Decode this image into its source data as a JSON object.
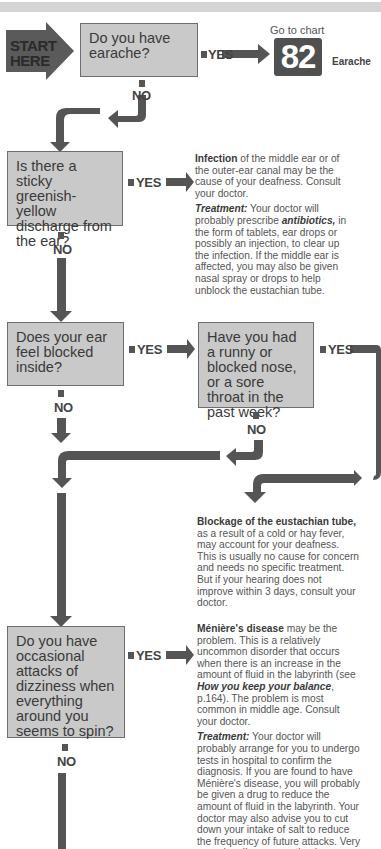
{
  "colors": {
    "box_fill": "#c9c9c9",
    "arrow": "#555555",
    "start_fill": "#5a5a5a",
    "chart_box": "#505050",
    "top_bar": "#d4d4d4"
  },
  "start": {
    "line1": "START",
    "line2": "HERE"
  },
  "labels": {
    "yes": "YES",
    "no": "NO"
  },
  "questions": {
    "q1": "Do you have earache?",
    "q2": "Is there a sticky greenish-yellow discharge from the ear?",
    "q3": "Does your ear feel blocked inside?",
    "q3b": "Have you had a runny or blocked nose, or a sore throat in the past week?",
    "q4": "Do you have occasional attacks of dizziness when everything around you seems to spin?"
  },
  "goto": {
    "prefix": "Go to chart",
    "number": "82",
    "name": "Earache"
  },
  "infection": {
    "title": "Infection",
    "text": " of the middle ear or of the outer-ear canal may be the cause of your deafness. Consult your doctor.",
    "treatment_label": "Treatment:",
    "treatment_a": " Your doctor will probably prescribe ",
    "treatment_em": "antibiotics,",
    "treatment_b": " in the form of tablets, ear drops or possibly an injection, to clear up the infection. If the middle ear is affected, you may also be given nasal spray or drops to help unblock the eustachian tube."
  },
  "blockage": {
    "title": "Blockage of the eustachian tube,",
    "text": " as a result of a cold or hay fever, may account for your deafness. This is usually no cause for concern and needs no specific treatment. But if your hearing does not improve within 3 days, consult your doctor."
  },
  "menieres": {
    "title": "Ménière's disease",
    "text_a": " may be the problem. This is a relatively uncommon disorder that occurs when there is an increase in the amount of fluid in the labyrinth (see ",
    "text_em": "How you keep your balance",
    "text_b": ", p.164). The problem is most common in middle age. Consult your doctor.",
    "treatment_label": "Treatment:",
    "treatment": " Your doctor will probably arrange for you to undergo tests in hospital to confirm the diagnosis. If you are found to have Ménière's disease, you will probably be given a drug to reduce the amount of fluid in the labyrinth. Your doctor may also advise you to cut down your intake of salt to reduce the frequency of future attacks. Very occasionally an operation is recommended."
  }
}
